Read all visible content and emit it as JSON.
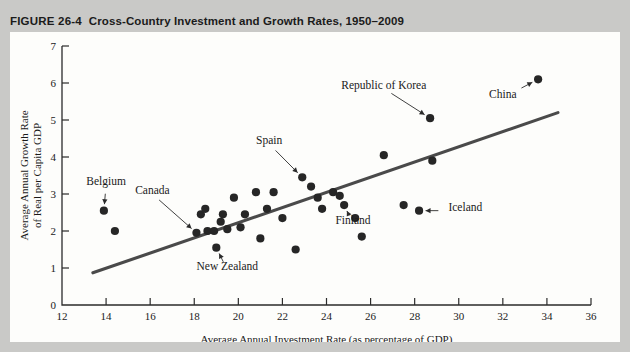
{
  "figure": {
    "number": "FIGURE 26-4",
    "title": "Cross-Country Investment and Growth Rates, 1950–2009"
  },
  "chart_data": {
    "type": "scatter",
    "title": "Cross-Country Investment and Growth Rates, 1950–2009",
    "xlabel": "Average Annual Investment Rate (as percentage of GDP)",
    "ylabel": "Average Annual Growth Rate of Real per Capita GDP",
    "xlim": [
      12,
      36
    ],
    "ylim": [
      0,
      7
    ],
    "xticks": [
      12,
      14,
      16,
      18,
      20,
      22,
      24,
      26,
      28,
      30,
      32,
      34,
      36
    ],
    "yticks": [
      0,
      1,
      2,
      3,
      4,
      5,
      6,
      7
    ],
    "grid": false,
    "legend": "none",
    "points": [
      {
        "x": 13.9,
        "y": 2.55,
        "label": "Belgium"
      },
      {
        "x": 14.4,
        "y": 2.0,
        "label": ""
      },
      {
        "x": 18.1,
        "y": 1.95,
        "label": "Canada"
      },
      {
        "x": 18.3,
        "y": 2.45,
        "label": ""
      },
      {
        "x": 18.5,
        "y": 2.6,
        "label": ""
      },
      {
        "x": 18.6,
        "y": 2.0,
        "label": ""
      },
      {
        "x": 18.9,
        "y": 2.0,
        "label": ""
      },
      {
        "x": 19.0,
        "y": 1.55,
        "label": "New Zealand"
      },
      {
        "x": 19.2,
        "y": 2.25,
        "label": ""
      },
      {
        "x": 19.3,
        "y": 2.45,
        "label": ""
      },
      {
        "x": 19.5,
        "y": 2.05,
        "label": ""
      },
      {
        "x": 19.8,
        "y": 2.9,
        "label": ""
      },
      {
        "x": 20.1,
        "y": 2.1,
        "label": ""
      },
      {
        "x": 20.3,
        "y": 2.45,
        "label": ""
      },
      {
        "x": 20.8,
        "y": 3.05,
        "label": ""
      },
      {
        "x": 21.0,
        "y": 1.8,
        "label": ""
      },
      {
        "x": 21.3,
        "y": 2.6,
        "label": ""
      },
      {
        "x": 21.6,
        "y": 3.05,
        "label": ""
      },
      {
        "x": 22.0,
        "y": 2.35,
        "label": ""
      },
      {
        "x": 22.6,
        "y": 1.5,
        "label": ""
      },
      {
        "x": 22.9,
        "y": 3.45,
        "label": "Spain"
      },
      {
        "x": 23.3,
        "y": 3.2,
        "label": ""
      },
      {
        "x": 23.6,
        "y": 2.9,
        "label": ""
      },
      {
        "x": 23.8,
        "y": 2.6,
        "label": ""
      },
      {
        "x": 24.3,
        "y": 3.05,
        "label": ""
      },
      {
        "x": 24.6,
        "y": 2.95,
        "label": ""
      },
      {
        "x": 24.8,
        "y": 2.7,
        "label": "Finland"
      },
      {
        "x": 25.3,
        "y": 2.35,
        "label": ""
      },
      {
        "x": 25.6,
        "y": 1.85,
        "label": ""
      },
      {
        "x": 26.6,
        "y": 4.05,
        "label": ""
      },
      {
        "x": 27.5,
        "y": 2.7,
        "label": ""
      },
      {
        "x": 28.2,
        "y": 2.55,
        "label": "Iceland"
      },
      {
        "x": 28.7,
        "y": 5.05,
        "label": "Republic of Korea"
      },
      {
        "x": 28.8,
        "y": 3.9,
        "label": ""
      },
      {
        "x": 33.6,
        "y": 6.1,
        "label": "China"
      }
    ],
    "trendline": {
      "x1": 13.4,
      "y1": 0.87,
      "x2": 34.5,
      "y2": 5.2
    },
    "annotations": [
      {
        "text": "Belgium",
        "tx": 14.0,
        "ty": 3.25,
        "px": 13.9,
        "py": 2.55
      },
      {
        "text": "Canada",
        "tx": 16.1,
        "ty": 3.0,
        "px": 18.1,
        "py": 1.95
      },
      {
        "text": "New Zealand",
        "tx": 19.5,
        "ty": 0.95,
        "px": 19.0,
        "py": 1.55
      },
      {
        "text": "Spain",
        "tx": 21.4,
        "ty": 4.35,
        "px": 22.9,
        "py": 3.45
      },
      {
        "text": "Republic of Korea",
        "tx": 26.6,
        "ty": 5.85,
        "px": 28.7,
        "py": 5.05
      },
      {
        "text": "China",
        "tx": 32.0,
        "ty": 5.6,
        "px": 33.6,
        "py": 6.1
      },
      {
        "text": "Iceland",
        "tx": 30.3,
        "ty": 2.55,
        "px": 28.2,
        "py": 2.55
      },
      {
        "text": "Finland",
        "tx": 25.2,
        "ty": 2.2,
        "px": 24.8,
        "py": 2.7
      }
    ]
  }
}
